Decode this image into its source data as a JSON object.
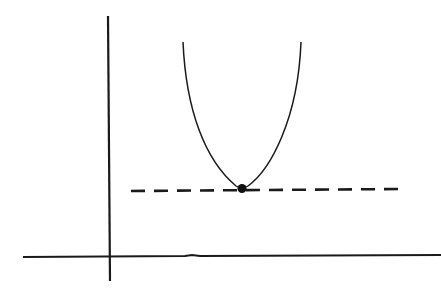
{
  "diagram": {
    "background": "#ffffff",
    "stroke_color": "#1a1a1a",
    "axes": {
      "y_axis": {
        "x": 108,
        "y1": 16,
        "y2": 281
      },
      "x_axis": {
        "y": 257,
        "x1": 23,
        "x2": 441
      }
    },
    "curve": {
      "type": "parabola",
      "left_top": [
        183,
        42
      ],
      "vertex": [
        242,
        188
      ],
      "right_top": [
        301,
        42
      ]
    },
    "minimum_point": {
      "x": 242,
      "y": 188,
      "r": 4.5
    },
    "tangent_line": {
      "style": "dashed",
      "y": 190,
      "x1": 131,
      "x2": 401
    }
  }
}
